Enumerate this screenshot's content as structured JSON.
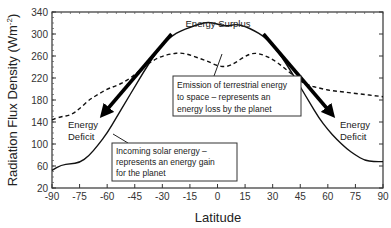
{
  "chart_data": {
    "type": "line",
    "title": "",
    "xlabel": "Latitude",
    "ylabel": "Radiation Flux Density (Wm⁻²)",
    "xlim": [
      -90,
      90
    ],
    "ylim": [
      20,
      340
    ],
    "x_ticks": [
      -90,
      -75,
      -60,
      -45,
      -30,
      -15,
      0,
      15,
      30,
      45,
      60,
      75,
      90
    ],
    "y_ticks": [
      20,
      60,
      100,
      140,
      180,
      220,
      260,
      300,
      340
    ],
    "grid": false,
    "legend": null,
    "series": [
      {
        "name": "Incoming solar energy",
        "style": "solid",
        "x": [
          -90,
          -85,
          -80,
          -75,
          -70,
          -65,
          -60,
          -55,
          -50,
          -45,
          -40,
          -35,
          -30,
          -25,
          -20,
          -15,
          -10,
          -5,
          0,
          5,
          10,
          15,
          20,
          25,
          30,
          35,
          40,
          45,
          50,
          55,
          60,
          65,
          70,
          75,
          80,
          85,
          90
        ],
        "values": [
          52,
          62,
          64,
          66,
          78,
          98,
          120,
          148,
          176,
          204,
          232,
          258,
          280,
          296,
          306,
          312,
          318,
          322,
          318,
          314,
          318,
          314,
          306,
          296,
          280,
          258,
          232,
          204,
          176,
          148,
          126,
          108,
          92,
          80,
          70,
          68,
          68
        ]
      },
      {
        "name": "Emission of terrestrial energy to space",
        "style": "dashed",
        "x": [
          -90,
          -85,
          -80,
          -75,
          -70,
          -65,
          -60,
          -55,
          -50,
          -45,
          -40,
          -35,
          -30,
          -25,
          -20,
          -15,
          -10,
          -5,
          0,
          5,
          10,
          15,
          20,
          25,
          30,
          35,
          40,
          45,
          50,
          55,
          60,
          65,
          70,
          75,
          80,
          85,
          90
        ],
        "values": [
          144,
          150,
          152,
          164,
          180,
          190,
          200,
          206,
          214,
          226,
          240,
          252,
          260,
          264,
          266,
          262,
          256,
          250,
          242,
          240,
          248,
          260,
          266,
          262,
          254,
          242,
          228,
          214,
          206,
          202,
          198,
          196,
          194,
          192,
          190,
          188,
          186
        ]
      }
    ],
    "annotations": [
      {
        "text": "Energy Surplus",
        "x": 0,
        "y": 305
      },
      {
        "text": "Energy Deficit",
        "x": -77,
        "y": 125,
        "lines": [
          "Energy",
          "Deficit"
        ]
      },
      {
        "text": "Energy Deficit",
        "x": 77,
        "y": 125,
        "lines": [
          "Energy",
          "Deficit"
        ]
      },
      {
        "text": "Emission of terrestrial energy to space – represents an energy loss by the planet",
        "lines": [
          "Emission of terrestrial energy",
          "to space – represents an",
          "energy loss by the planet"
        ]
      },
      {
        "text": "Incoming solar energy – represents an energy gain for the planet",
        "lines": [
          "Incoming solar energy –",
          "represents an energy gain",
          "for the planet"
        ]
      }
    ],
    "arrows": [
      {
        "from": [
          -25,
          300
        ],
        "to": [
          -62,
          155
        ],
        "meaning": "energy transport poleward (south)"
      },
      {
        "from": [
          25,
          300
        ],
        "to": [
          62,
          155
        ],
        "meaning": "energy transport poleward (north)"
      }
    ]
  },
  "labels": {
    "ylabel": "Radiation Flux Density (Wm",
    "ylabel_sup": "-2",
    "ylabel_close": ")",
    "xlabel": "Latitude",
    "surplus": "Energy Surplus",
    "deficit_line1": "Energy",
    "deficit_line2": "Deficit",
    "emission_lines": [
      "Emission of terrestrial energy",
      "to space – represents an",
      "energy loss by the planet"
    ],
    "incoming_lines": [
      "Incoming solar energy –",
      "represents an energy gain",
      "for the planet"
    ]
  }
}
